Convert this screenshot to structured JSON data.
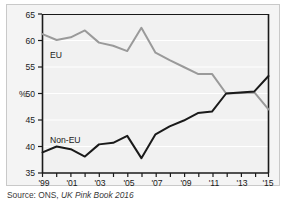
{
  "figure": {
    "background_color": "#f4f4f4",
    "border_color": "#c9c9c9",
    "page_background": "#ffffff"
  },
  "caption": {
    "prefix": "Source: ONS, ",
    "publication": "UK Pink Book 2016"
  },
  "axis": {
    "y_unit_label": "%",
    "y_ticks": [
      "35",
      "40",
      "45",
      "50",
      "55",
      "60",
      "65"
    ],
    "x_ticks": [
      "'99",
      "'01",
      "'03",
      "'05",
      "'07",
      "'09",
      "'11",
      "'13",
      "'15"
    ]
  },
  "labels": {
    "eu": "EU",
    "non_eu": "Non-EU"
  },
  "chart_data": {
    "type": "line",
    "title": "",
    "subtitle": "",
    "xlabel": "",
    "ylabel": "%",
    "ylim": [
      35,
      65
    ],
    "xlim": [
      1999,
      2015
    ],
    "ytick_step": 5,
    "grid": true,
    "grid_color": "#ffffff",
    "legend_position": "inline-annotation",
    "x": [
      1999,
      2000,
      2001,
      2002,
      2003,
      2004,
      2005,
      2006,
      2007,
      2008,
      2009,
      2010,
      2011,
      2012,
      2013,
      2014,
      2015
    ],
    "series": [
      {
        "name": "EU",
        "color": "#9a9a9a",
        "values": [
          61.2,
          60.1,
          60.6,
          61.9,
          59.6,
          59.0,
          58.0,
          62.4,
          57.7,
          56.3,
          55.0,
          53.7,
          53.7,
          50.0,
          50.1,
          50.2,
          47.0
        ]
      },
      {
        "name": "Non-EU",
        "color": "#1a1a1a",
        "values": [
          38.9,
          40.0,
          39.5,
          38.1,
          40.4,
          40.7,
          42.0,
          37.8,
          42.3,
          43.8,
          44.9,
          46.3,
          46.6,
          50.0,
          50.2,
          50.4,
          53.3
        ]
      }
    ]
  }
}
